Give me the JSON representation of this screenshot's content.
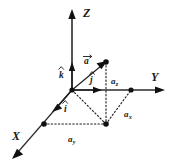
{
  "figure": {
    "background_color": "#ffffff",
    "ink_color": "#1a1a1a"
  },
  "axes": {
    "z": {
      "label": "Z",
      "direction": "up",
      "arrow": "up-arrow-icon"
    },
    "y": {
      "label": "Y",
      "direction": "right",
      "arrow": "right-arrow-icon"
    },
    "x": {
      "label": "X",
      "direction": "down-left",
      "arrow": "down-left-arrow-icon"
    }
  },
  "vectors": {
    "main": {
      "label": "a",
      "accent": "arrow",
      "description": "position vector a"
    },
    "unit_k": {
      "label": "k",
      "accent": "hat",
      "description": "unit vector along Z"
    },
    "unit_j": {
      "label": "j",
      "accent": "hat",
      "description": "unit vector along Y"
    },
    "unit_i": {
      "label": "i",
      "accent": "hat",
      "description": "unit vector along X"
    }
  },
  "components": {
    "az": {
      "base": "a",
      "subscript": "z",
      "label": "az"
    },
    "ax": {
      "base": "a",
      "subscript": "x",
      "label": "ax"
    },
    "ay": {
      "base": "a",
      "subscript": "y",
      "label": "ay"
    }
  },
  "points": [
    {
      "name": "origin",
      "x": 72,
      "y": 90
    },
    {
      "name": "vector-tip",
      "x": 106,
      "y": 62
    },
    {
      "name": "xy-projection",
      "x": 106,
      "y": 124
    },
    {
      "name": "y-axis-point",
      "x": 131,
      "y": 90
    },
    {
      "name": "x-axis-point",
      "x": 44,
      "y": 124
    }
  ]
}
